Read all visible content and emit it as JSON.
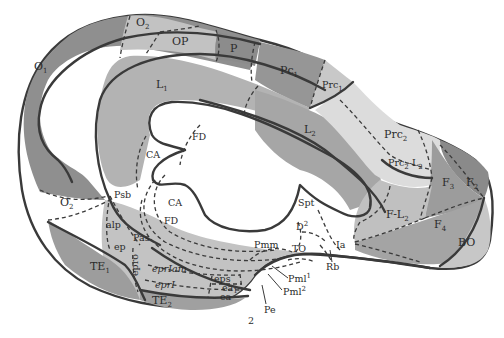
{
  "figure": {
    "type": "cortical area map (brain hemisphere, medial view)",
    "page_mark": "2",
    "colors": {
      "background": "#ffffff",
      "outline": "#3a3a3a",
      "dark_region": "#8e8e8e",
      "mid_region": "#a8a8a8",
      "light_region": "#c4c4c4",
      "lighter_region": "#d8d8d8",
      "ventricle": "#fafafa"
    }
  },
  "regions": {
    "O1": {
      "label": "O",
      "sub": "1"
    },
    "O2_top": {
      "label": "O",
      "sub": "2"
    },
    "OP": {
      "label": "OP"
    },
    "P": {
      "label": "P"
    },
    "Pc1": {
      "label": "Pc",
      "sub": "1"
    },
    "Prc1": {
      "label": "Prc",
      "sub": "1"
    },
    "L1": {
      "label": "L",
      "sub": "1"
    },
    "L2": {
      "label": "L",
      "sub": "2"
    },
    "Prc2": {
      "label": "Prc",
      "sub": "2"
    },
    "Prc2L2": {
      "label": "Prc",
      "sub": "2",
      "suffix": "-L",
      "sub2": "2"
    },
    "F2": {
      "label": "F",
      "sub": "2"
    },
    "F3": {
      "label": "F",
      "sub": "3"
    },
    "F4": {
      "label": "F",
      "sub": "4"
    },
    "FL2": {
      "label": "F-L",
      "sub": "2"
    },
    "BO": {
      "label": "BO"
    },
    "FD_top": {
      "label": "FD"
    },
    "CA_top": {
      "label": "CA"
    },
    "CA_inner": {
      "label": "CA"
    },
    "FD_inner": {
      "label": "FD"
    },
    "O2_bottom": {
      "label": "O",
      "sub": "2"
    },
    "Psb": {
      "label": "Psb"
    },
    "alp": {
      "label": "alp"
    },
    "ep": {
      "label": "ep"
    },
    "Pas": {
      "label": "Pas"
    },
    "epro": {
      "label": "epro"
    },
    "TE1": {
      "label": "TE",
      "sub": "1"
    },
    "TE2": {
      "label": "TE",
      "sub": "2"
    },
    "eprfam": {
      "label": "eprIam"
    },
    "eprI": {
      "label": "eprI"
    },
    "eps": {
      "label": "eps"
    },
    "ea1": {
      "label": "ea",
      "sub": "1"
    },
    "ea": {
      "label": "ea"
    },
    "Spt": {
      "label": "Spt"
    },
    "D2": {
      "label": "D",
      "sup": "2"
    },
    "Pmm": {
      "label": "Pmm"
    },
    "TO": {
      "label": "TO"
    },
    "Ia": {
      "label": "Ia"
    },
    "Rb": {
      "label": "Rb"
    },
    "Pml1": {
      "label": "Pml",
      "sup": "1"
    },
    "Pml2": {
      "label": "Pml",
      "sup": "2"
    },
    "Pe": {
      "label": "Pe"
    }
  }
}
